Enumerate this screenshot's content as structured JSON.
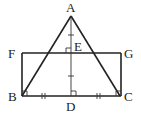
{
  "diagram": {
    "points": {
      "A": "A",
      "B": "B",
      "C": "C",
      "D": "D",
      "E": "E",
      "F": "F",
      "G": "G"
    },
    "segments": [
      "AB",
      "AC",
      "AD",
      "FG",
      "FB",
      "GC",
      "BC"
    ],
    "markings": {
      "equal_single_tick": [
        "AE",
        "ED"
      ],
      "equal_double_tick": [
        "BD",
        "DC"
      ],
      "right_angles": [
        "AEG",
        "ADC",
        "FBC",
        "GCB"
      ]
    }
  }
}
